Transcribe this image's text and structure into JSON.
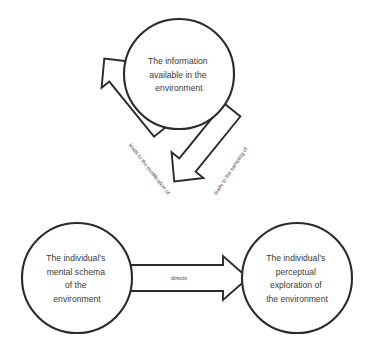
{
  "diagram": {
    "type": "cycle-diagram",
    "title": "",
    "colors": {
      "stroke": "#2b2b2b",
      "fill": "#ffffff",
      "text": "#3a3a3a",
      "edge_text": "#4a4a4a"
    },
    "nodes": [
      {
        "id": "information",
        "shape": "circle",
        "lines": [
          "The information",
          "available in the",
          "environment"
        ]
      },
      {
        "id": "mental-schema",
        "shape": "circle",
        "lines": [
          "The individual’s",
          "mental schema",
          "of the",
          "environment"
        ]
      },
      {
        "id": "perceptual-exploration",
        "shape": "circle",
        "lines": [
          "The individual’s",
          "perceptual",
          "exploration of",
          "the environment"
        ]
      }
    ],
    "edges": [
      {
        "id": "information-to-schema",
        "label": "leads to the modification of",
        "from": "information",
        "to": "mental-schema",
        "direction": "down-left"
      },
      {
        "id": "schema-to-exploration",
        "label": "directs",
        "from": "mental-schema",
        "to": "perceptual-exploration",
        "direction": "right"
      },
      {
        "id": "exploration-to-information",
        "label": "leads to the sampling of",
        "from": "perceptual-exploration",
        "to": "information",
        "direction": "up-right"
      }
    ]
  }
}
